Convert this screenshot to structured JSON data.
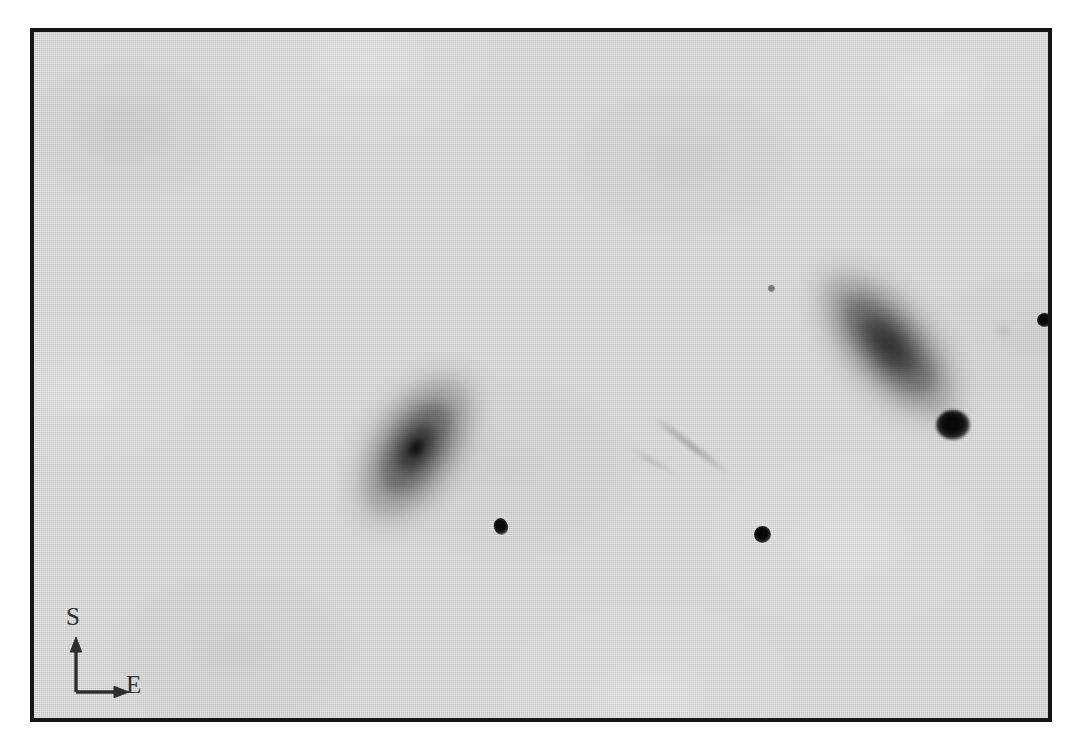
{
  "figure": {
    "type": "astronomical-plate-photograph",
    "background_color": "#d8d8d8",
    "frame_color": "#141414",
    "frame": {
      "left": 30,
      "top": 28,
      "width": 1022,
      "height": 694,
      "border_width": 4
    }
  },
  "compass": {
    "name": "orientation-compass",
    "north_up_label": "S",
    "east_right_label": "E",
    "vertical_arrow_direction": "up",
    "horizontal_arrow_direction": "right",
    "color": "#2e2e2e"
  },
  "objects": {
    "galaxies": [
      {
        "id": "galaxy-left",
        "label": "left-galaxy",
        "center_x": 382,
        "center_y": 416,
        "major_axis_px": 200,
        "minor_axis_px": 118,
        "position_angle_deg": -57,
        "nucleus_x": 378,
        "nucleus_y": 423,
        "morphology": "elongated-disk"
      },
      {
        "id": "galaxy-right",
        "label": "right-galaxy",
        "center_x": 855,
        "center_y": 313,
        "major_axis_px": 216,
        "minor_axis_px": 116,
        "position_angle_deg": 48,
        "nucleus_x": 902,
        "nucleus_y": 378,
        "morphology": "elongated-disk-with-bright-knot"
      }
    ],
    "knots": [
      {
        "id": "galaxy-right-knot",
        "label": "bright-compact-knot",
        "x": 902,
        "y": 378,
        "size_px": 34
      }
    ],
    "stars": [
      {
        "id": "star-1",
        "label": "star-east-field",
        "x": 1010,
        "y": 290,
        "size_px": 15
      },
      {
        "id": "star-2",
        "label": "star-near-left-galaxy",
        "x": 467,
        "y": 496,
        "size_px": 14
      },
      {
        "id": "star-3",
        "label": "star-field-center",
        "x": 728,
        "y": 504,
        "size_px": 17
      },
      {
        "id": "star-4",
        "label": "faint-star-upper-field",
        "x": 737,
        "y": 258,
        "size_px": 7
      }
    ],
    "artifacts": [
      {
        "id": "plate-streak",
        "label": "faint-diagonal-streak",
        "x": 622,
        "y": 384,
        "length_px": 96,
        "angle_deg": 37
      },
      {
        "id": "plate-streak-2",
        "label": "faint-diagonal-streak-secondary",
        "x": 596,
        "y": 414,
        "length_px": 60,
        "angle_deg": 30
      },
      {
        "id": "smudge-1",
        "label": "faint-diffuse-smudge",
        "x": 968,
        "y": 300,
        "size_px": 10
      }
    ]
  }
}
